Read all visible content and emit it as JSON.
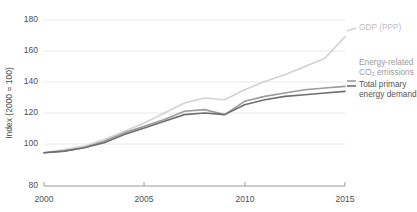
{
  "chart_data": {
    "type": "line",
    "title": "",
    "subtitle": "",
    "xlabel": "",
    "ylabel": "Index (2000 = 100)",
    "xlim": [
      2000,
      2015
    ],
    "ylim": [
      80,
      180
    ],
    "yticks": [
      80,
      100,
      120,
      140,
      160,
      180
    ],
    "xticks": [
      2000,
      2005,
      2010,
      2015
    ],
    "grid": "horizontal",
    "legend_position": "right-inline",
    "x": [
      2000,
      2001,
      2002,
      2003,
      2004,
      2005,
      2006,
      2007,
      2008,
      2009,
      2010,
      2011,
      2012,
      2013,
      2014,
      2015
    ],
    "series": [
      {
        "name": "GDP (PPP)",
        "color": "#d2d2d2",
        "values": [
          100,
          102,
          104,
          108,
          113,
          118,
          124,
          130,
          133,
          132,
          138,
          143,
          147,
          152,
          157,
          170
        ]
      },
      {
        "name": "Energy-related CO₂ emissions",
        "color": "#9b9b9b",
        "values": [
          100,
          101,
          103,
          107,
          112,
          116,
          120,
          125,
          126,
          123,
          131,
          134,
          136,
          138,
          139,
          140
        ]
      },
      {
        "name": "Total primary energy demand",
        "color": "#6e6e6e",
        "values": [
          100,
          101,
          103,
          106,
          111,
          115,
          119,
          123,
          124,
          123,
          129,
          132,
          134,
          135,
          136,
          137
        ]
      }
    ]
  },
  "axis": {
    "y_title": "Index (2000 = 100)",
    "y_labels": [
      "180",
      "160",
      "140",
      "120",
      "100",
      "80"
    ],
    "x_labels": [
      "2000",
      "2005",
      "2010",
      "2015"
    ]
  },
  "legend": {
    "gdp": {
      "label": "GDP (PPP)"
    },
    "co2": {
      "line1": "Energy-related",
      "line2": "CO₂ emissions"
    },
    "tpe": {
      "line1": "Total primary",
      "line2": "energy demand"
    }
  },
  "colors": {
    "gdp": "#d2d2d2",
    "co2": "#9b9b9b",
    "tpe": "#6e6e6e",
    "grid": "#e8e8e8",
    "axis": "#9a9a9a",
    "text": "#4d4d4d",
    "legend_light": "#bdbdbd",
    "legend_mid": "#9b9b9b",
    "legend_dark": "#555555"
  }
}
